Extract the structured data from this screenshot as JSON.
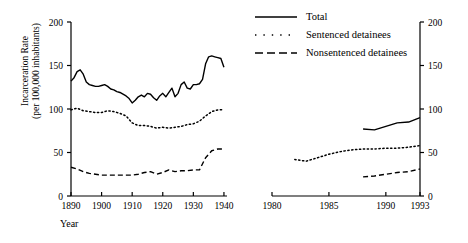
{
  "figure": {
    "ylabel_line1": "Incarceration Rate",
    "ylabel_line2": "(per 100,000 inhabitants)",
    "xlabel": "Year"
  },
  "legend": {
    "items": [
      {
        "label": "Total",
        "style": "solid",
        "key": "line-solid-icon"
      },
      {
        "label": "Sentenced detainees",
        "style": "dotted",
        "key": "line-dotted-icon"
      },
      {
        "label": "Nonsentenced detainees",
        "style": "dashed",
        "key": "line-dashed-icon"
      }
    ]
  },
  "chart_data": {
    "type": "line",
    "title": "",
    "xlabel": "Year",
    "ylabel": "Incarceration Rate (per 100,000 inhabitants)",
    "ylim": [
      0,
      200
    ],
    "yticks": [
      0,
      50,
      100,
      150,
      200
    ],
    "grid": false,
    "legend_position": "top-right",
    "broken_axis": true,
    "panels": [
      {
        "name": "left-panel",
        "xlim": [
          1890,
          1941
        ],
        "xticks": [
          1890,
          1900,
          1910,
          1920,
          1930,
          1940
        ],
        "xticklabels": [
          "1890",
          "1900",
          "1910",
          "1920",
          "1930",
          "1940"
        ],
        "series": [
          {
            "name": "Total",
            "style": "solid",
            "x": [
              1890,
              1891,
              1892,
              1893,
              1894,
              1895,
              1896,
              1897,
              1898,
              1899,
              1900,
              1901,
              1902,
              1903,
              1904,
              1905,
              1906,
              1907,
              1908,
              1909,
              1910,
              1911,
              1912,
              1913,
              1914,
              1915,
              1916,
              1917,
              1918,
              1919,
              1920,
              1921,
              1922,
              1923,
              1924,
              1925,
              1926,
              1927,
              1928,
              1929,
              1930,
              1931,
              1932,
              1933,
              1934,
              1935,
              1936,
              1937,
              1938,
              1939,
              1940
            ],
            "values": [
              132,
              136,
              143,
              145,
              140,
              131,
              128,
              127,
              126,
              126,
              127,
              128,
              126,
              123,
              122,
              120,
              119,
              117,
              115,
              112,
              107,
              110,
              114,
              116,
              114,
              118,
              117,
              113,
              110,
              115,
              118,
              114,
              119,
              124,
              114,
              118,
              128,
              131,
              124,
              123,
              128,
              128,
              129,
              134,
              152,
              160,
              161,
              160,
              159,
              158,
              148
            ]
          },
          {
            "name": "Sentenced detainees",
            "style": "dotted",
            "x": [
              1890,
              1892,
              1894,
              1896,
              1898,
              1900,
              1902,
              1904,
              1906,
              1908,
              1910,
              1912,
              1914,
              1916,
              1918,
              1920,
              1922,
              1924,
              1926,
              1928,
              1930,
              1932,
              1934,
              1936,
              1938,
              1940
            ],
            "values": [
              99,
              101,
              98,
              97,
              96,
              96,
              98,
              97,
              95,
              92,
              84,
              81,
              81,
              80,
              78,
              79,
              78,
              79,
              80,
              82,
              83,
              86,
              92,
              97,
              99,
              99
            ]
          },
          {
            "name": "Nonsentenced detainees",
            "style": "dashed",
            "x": [
              1890,
              1892,
              1894,
              1896,
              1898,
              1900,
              1902,
              1904,
              1906,
              1908,
              1910,
              1912,
              1914,
              1916,
              1918,
              1920,
              1922,
              1924,
              1926,
              1928,
              1930,
              1932,
              1934,
              1936,
              1938,
              1940
            ],
            "values": [
              33,
              31,
              28,
              26,
              25,
              24,
              24,
              24,
              24,
              24,
              24,
              25,
              27,
              28,
              25,
              27,
              30,
              28,
              29,
              29,
              30,
              30,
              44,
              52,
              54,
              54
            ]
          }
        ]
      },
      {
        "name": "right-panel",
        "xlim": [
          1980,
          1993
        ],
        "xticks": [
          1980,
          1985,
          1990,
          1993
        ],
        "xticklabels": [
          "1980",
          "1985",
          "1990",
          "1993"
        ],
        "series": [
          {
            "name": "Total",
            "style": "solid",
            "x": [
              1988,
              1989,
              1990,
              1991,
              1992,
              1993
            ],
            "values": [
              77,
              76,
              80,
              84,
              85,
              90
            ]
          },
          {
            "name": "Sentenced detainees",
            "style": "dotted",
            "x": [
              1982,
              1983,
              1984,
              1985,
              1986,
              1987,
              1988,
              1989,
              1990,
              1991,
              1992,
              1993
            ],
            "values": [
              42,
              40,
              44,
              48,
              51,
              53,
              54,
              54,
              55,
              55,
              56,
              58
            ]
          },
          {
            "name": "Nonsentenced detainees",
            "style": "dashed",
            "x": [
              1988,
              1989,
              1990,
              1991,
              1992,
              1993
            ],
            "values": [
              22,
              23,
              25,
              27,
              28,
              31
            ]
          }
        ]
      }
    ]
  }
}
